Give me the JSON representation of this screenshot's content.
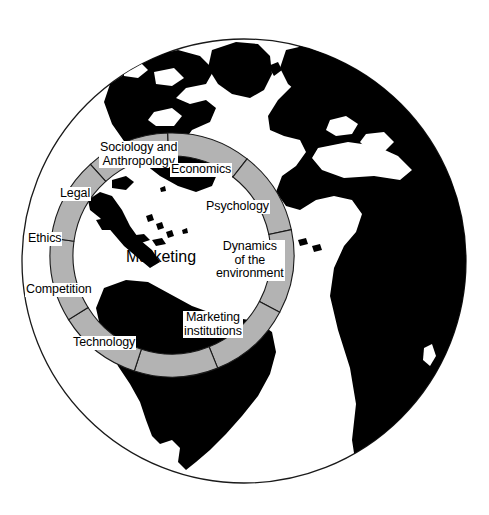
{
  "figure": {
    "center_label": "Marketing",
    "globe": {
      "outline_color": "#1a1a1a",
      "land_color": "#000000",
      "ocean_color": "#ffffff",
      "center_x": 244,
      "center_y": 261,
      "radius": 222
    },
    "ring": {
      "fill_color": "#b3b3b3",
      "stroke_color": "#1a1a1a",
      "center_x": 172,
      "center_y": 255,
      "outer_radius": 122,
      "inner_radius": 99,
      "segment_count": 9
    },
    "segments": [
      {
        "name": "sociology-and-anthropology",
        "label_lines": [
          "Sociology and",
          "Anthropology"
        ],
        "label_x": 99,
        "label_y": 141
      },
      {
        "name": "economics",
        "label_lines": [
          "Economics"
        ],
        "label_x": 170,
        "label_y": 163
      },
      {
        "name": "psychology",
        "label_lines": [
          "Psychology"
        ],
        "label_x": 205,
        "label_y": 200
      },
      {
        "name": "dynamics-of-the-environment",
        "label_lines": [
          "Dynamics",
          "of the",
          "environment"
        ],
        "label_x": 215,
        "label_y": 240
      },
      {
        "name": "marketing-institutions",
        "label_lines": [
          "Marketing",
          "institutions"
        ],
        "label_x": 183,
        "label_y": 311
      },
      {
        "name": "technology",
        "label_lines": [
          "Technology"
        ],
        "label_x": 72,
        "label_y": 336
      },
      {
        "name": "competition",
        "label_lines": [
          "Competition"
        ],
        "label_x": 25,
        "label_y": 283
      },
      {
        "name": "ethics",
        "label_lines": [
          "Ethics"
        ],
        "label_x": 27,
        "label_y": 232
      },
      {
        "name": "legal",
        "label_lines": [
          "Legal"
        ],
        "label_x": 59,
        "label_y": 187
      }
    ]
  }
}
